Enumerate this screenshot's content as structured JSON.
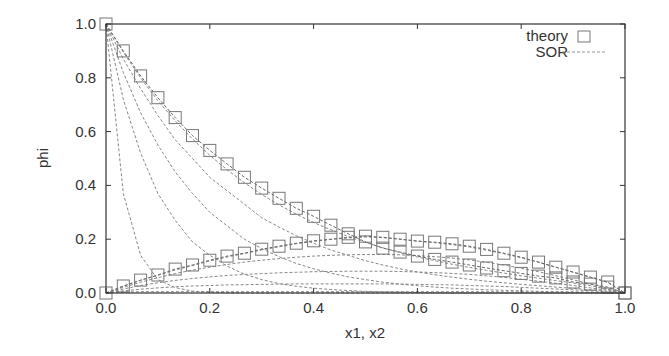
{
  "chart_data": {
    "type": "line",
    "title": "",
    "xlabel": "x1, x2",
    "ylabel": "phi",
    "xlim": [
      0.0,
      1.0
    ],
    "ylim": [
      0.0,
      1.0
    ],
    "grid": false,
    "legend_position": "top-right",
    "x_ticks": [
      "0.0",
      "0.2",
      "0.4",
      "0.6",
      "0.8",
      "1.0"
    ],
    "y_ticks": [
      "0.0",
      "0.2",
      "0.4",
      "0.6",
      "0.8",
      "1.0"
    ],
    "legend": [
      {
        "label": "theory",
        "style": "open-square-marker"
      },
      {
        "label": "SOR",
        "style": "dashed-line"
      }
    ],
    "x": [
      0.0,
      0.0333,
      0.0667,
      0.1,
      0.1333,
      0.1667,
      0.2,
      0.2333,
      0.2667,
      0.3,
      0.3333,
      0.3667,
      0.4,
      0.4333,
      0.4667,
      0.5,
      0.5333,
      0.5667,
      0.6,
      0.6333,
      0.6667,
      0.7,
      0.7333,
      0.7667,
      0.8,
      0.8333,
      0.8667,
      0.9,
      0.9333,
      0.9667,
      1.0
    ],
    "series": [
      {
        "name": "theory phi1 (x1)",
        "style": "open-square-marker",
        "values": [
          1.0,
          0.9,
          0.807,
          0.726,
          0.652,
          0.585,
          0.53,
          0.48,
          0.43,
          0.39,
          0.352,
          0.315,
          0.285,
          0.252,
          0.22,
          0.19,
          0.167,
          0.152,
          0.137,
          0.125,
          0.115,
          0.104,
          0.093,
          0.083,
          0.073,
          0.063,
          0.056,
          0.041,
          0.033,
          0.022,
          0.0
        ]
      },
      {
        "name": "theory phi2 (x2)",
        "style": "open-square-marker",
        "values": [
          0.0,
          0.026,
          0.048,
          0.067,
          0.089,
          0.104,
          0.122,
          0.137,
          0.148,
          0.163,
          0.174,
          0.185,
          0.194,
          0.2,
          0.207,
          0.211,
          0.207,
          0.2,
          0.193,
          0.189,
          0.183,
          0.174,
          0.162,
          0.148,
          0.133,
          0.115,
          0.096,
          0.078,
          0.059,
          0.041,
          0.0
        ]
      }
    ],
    "sor_iterations": [
      {
        "name": "SOR phi1 iter a",
        "values": [
          1.0,
          0.37,
          0.14,
          0.05,
          0.02,
          0.007,
          0.003,
          0.001,
          0,
          0,
          0,
          0,
          0,
          0,
          0,
          0,
          0,
          0,
          0,
          0,
          0,
          0,
          0,
          0,
          0,
          0,
          0,
          0,
          0,
          0,
          0
        ]
      },
      {
        "name": "SOR phi1 iter b",
        "values": [
          1.0,
          0.72,
          0.52,
          0.37,
          0.27,
          0.19,
          0.14,
          0.1,
          0.07,
          0.05,
          0.035,
          0.025,
          0.018,
          0.013,
          0.009,
          0.006,
          0.004,
          0.003,
          0.002,
          0.001,
          0,
          0,
          0,
          0,
          0,
          0,
          0,
          0,
          0,
          0,
          0
        ]
      },
      {
        "name": "SOR phi1 iter c",
        "values": [
          1.0,
          0.82,
          0.67,
          0.55,
          0.45,
          0.37,
          0.3,
          0.25,
          0.2,
          0.165,
          0.135,
          0.11,
          0.09,
          0.074,
          0.06,
          0.05,
          0.04,
          0.033,
          0.027,
          0.022,
          0.018,
          0.015,
          0.012,
          0.01,
          0.008,
          0.006,
          0.005,
          0.004,
          0.003,
          0.001,
          0.0
        ]
      },
      {
        "name": "SOR phi1 iter d",
        "values": [
          1.0,
          0.87,
          0.76,
          0.66,
          0.57,
          0.5,
          0.43,
          0.38,
          0.33,
          0.28,
          0.245,
          0.213,
          0.185,
          0.16,
          0.14,
          0.12,
          0.104,
          0.09,
          0.078,
          0.068,
          0.059,
          0.051,
          0.044,
          0.038,
          0.032,
          0.027,
          0.022,
          0.017,
          0.012,
          0.006,
          0.0
        ]
      },
      {
        "name": "SOR phi1 iter e",
        "values": [
          1.0,
          0.895,
          0.8,
          0.715,
          0.64,
          0.572,
          0.512,
          0.458,
          0.41,
          0.366,
          0.328,
          0.293,
          0.262,
          0.235,
          0.21,
          0.188,
          0.168,
          0.15,
          0.134,
          0.12,
          0.107,
          0.095,
          0.084,
          0.074,
          0.064,
          0.055,
          0.046,
          0.037,
          0.027,
          0.014,
          0.0
        ]
      },
      {
        "name": "SOR phi2 iter a",
        "values": [
          0.0,
          0.004,
          0.005,
          0.005,
          0.005,
          0.005,
          0.005,
          0.005,
          0.005,
          0.005,
          0.005,
          0.005,
          0.005,
          0.005,
          0.005,
          0.005,
          0.005,
          0.005,
          0.005,
          0.005,
          0.005,
          0.005,
          0.005,
          0.004,
          0.004,
          0.004,
          0.003,
          0.003,
          0.002,
          0.001,
          0.0
        ]
      },
      {
        "name": "SOR phi2 iter b",
        "values": [
          0.0,
          0.008,
          0.014,
          0.019,
          0.023,
          0.026,
          0.028,
          0.03,
          0.031,
          0.032,
          0.033,
          0.034,
          0.034,
          0.034,
          0.034,
          0.034,
          0.034,
          0.033,
          0.032,
          0.031,
          0.03,
          0.028,
          0.026,
          0.024,
          0.021,
          0.018,
          0.015,
          0.012,
          0.008,
          0.004,
          0.0
        ]
      },
      {
        "name": "SOR phi2 iter c",
        "values": [
          0.0,
          0.015,
          0.028,
          0.038,
          0.047,
          0.054,
          0.06,
          0.065,
          0.069,
          0.072,
          0.075,
          0.077,
          0.079,
          0.08,
          0.081,
          0.081,
          0.081,
          0.08,
          0.078,
          0.076,
          0.073,
          0.069,
          0.064,
          0.058,
          0.051,
          0.044,
          0.036,
          0.028,
          0.019,
          0.01,
          0.0
        ]
      },
      {
        "name": "SOR phi2 iter d",
        "values": [
          0.0,
          0.021,
          0.04,
          0.057,
          0.072,
          0.085,
          0.096,
          0.106,
          0.115,
          0.122,
          0.128,
          0.133,
          0.137,
          0.14,
          0.142,
          0.143,
          0.143,
          0.142,
          0.139,
          0.135,
          0.13,
          0.123,
          0.114,
          0.104,
          0.092,
          0.079,
          0.064,
          0.049,
          0.034,
          0.017,
          0.0
        ]
      },
      {
        "name": "SOR phi2 iter e",
        "values": [
          0.0,
          0.025,
          0.047,
          0.066,
          0.086,
          0.102,
          0.119,
          0.134,
          0.147,
          0.16,
          0.172,
          0.183,
          0.192,
          0.199,
          0.205,
          0.208,
          0.206,
          0.2,
          0.193,
          0.187,
          0.18,
          0.171,
          0.159,
          0.146,
          0.131,
          0.114,
          0.096,
          0.077,
          0.058,
          0.039,
          0.0
        ]
      }
    ]
  },
  "colors": {
    "axis": "#333333",
    "marker": "#777777",
    "sor_line": "#888888",
    "background": "#ffffff"
  }
}
